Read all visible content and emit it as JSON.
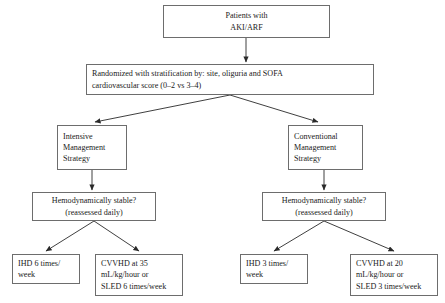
{
  "diagram": {
    "stroke_color": "#6d6d6d",
    "line_color": "#2a2a2a",
    "text_color": "#1a1a1a",
    "background": "#ffffff",
    "nodes": [
      {
        "id": "enrollment",
        "align": "center",
        "lines": [
          "Patients with",
          "AKI/ARF"
        ],
        "x": 163,
        "y": 5,
        "w": 167,
        "h": 33
      },
      {
        "id": "randomization",
        "align": "left",
        "lines": [
          "Randomized with stratification by: site, oliguria and SOFA",
          "cardiovascular score (0–2 vs 3–4)"
        ],
        "x": 86,
        "y": 64,
        "w": 288,
        "h": 31
      },
      {
        "id": "intensive-strategy",
        "align": "left",
        "lines": [
          "Intensive",
          "Management",
          "Strategy"
        ],
        "x": 57,
        "y": 125,
        "w": 70,
        "h": 45
      },
      {
        "id": "conventional-strategy",
        "align": "left",
        "lines": [
          "Conventional",
          "Management",
          "Strategy"
        ],
        "x": 288,
        "y": 125,
        "w": 75,
        "h": 45
      },
      {
        "id": "intensive-hemodynamic-check",
        "align": "center",
        "lines": [
          "Hemodynamically stable?",
          "(reassessed daily)"
        ],
        "x": 32,
        "y": 192,
        "w": 124,
        "h": 29
      },
      {
        "id": "conventional-hemodynamic-check",
        "align": "center",
        "lines": [
          "Hemodynamically stable?",
          "(reassessed daily)"
        ],
        "x": 262,
        "y": 192,
        "w": 124,
        "h": 29
      },
      {
        "id": "intensive-ihd",
        "align": "left",
        "lines": [
          "IHD 6 times/",
          "week"
        ],
        "x": 12,
        "y": 254,
        "w": 68,
        "h": 30
      },
      {
        "id": "intensive-cvvhd",
        "align": "left",
        "lines": [
          "CVVHD at 35",
          "mL/kg/hour or",
          "SLED 6 times/week"
        ],
        "x": 95,
        "y": 254,
        "w": 88,
        "h": 42
      },
      {
        "id": "conventional-ihd",
        "align": "left",
        "lines": [
          "IHD 3 times/",
          "week"
        ],
        "x": 240,
        "y": 254,
        "w": 68,
        "h": 30
      },
      {
        "id": "conventional-cvvhd",
        "align": "left",
        "lines": [
          "CVVHD at 20",
          "mL/kg/hour or",
          "SLED 3 times/week"
        ],
        "x": 350,
        "y": 254,
        "w": 88,
        "h": 42
      }
    ],
    "connectors": [
      {
        "id": "enrollment-to-randomization",
        "kind": "vertical",
        "x": 246,
        "y1": 38,
        "y2": 62
      },
      {
        "id": "randomization-to-intensive",
        "kind": "diagonal",
        "x1": 230,
        "y1": 95,
        "x2": 95,
        "y2": 122
      },
      {
        "id": "randomization-to-conventional",
        "kind": "diagonal",
        "x1": 230,
        "y1": 95,
        "x2": 318,
        "y2": 122
      },
      {
        "id": "intensive-to-check",
        "kind": "vertical",
        "x": 92,
        "y1": 170,
        "y2": 190
      },
      {
        "id": "conventional-to-check",
        "kind": "vertical",
        "x": 324,
        "y1": 170,
        "y2": 190
      },
      {
        "id": "intensive-check-to-ihd",
        "kind": "diagonal",
        "x1": 94,
        "y1": 221,
        "x2": 46,
        "y2": 251
      },
      {
        "id": "intensive-check-to-cvvhd",
        "kind": "diagonal",
        "x1": 94,
        "y1": 221,
        "x2": 139,
        "y2": 251
      },
      {
        "id": "conventional-check-to-ihd",
        "kind": "diagonal",
        "x1": 324,
        "y1": 221,
        "x2": 274,
        "y2": 251
      },
      {
        "id": "conventional-check-to-cvvhd",
        "kind": "diagonal",
        "x1": 324,
        "y1": 221,
        "x2": 394,
        "y2": 251
      }
    ]
  }
}
